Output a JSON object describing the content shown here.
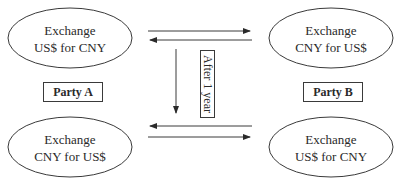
{
  "diagram": {
    "nodes": {
      "party_a_top": {
        "line1": "Exchange",
        "line2": "US$ for CNY"
      },
      "party_b_top": {
        "line1": "Exchange",
        "line2": "CNY for US$"
      },
      "party_a_bottom": {
        "line1": "Exchange",
        "line2": "CNY for US$"
      },
      "party_b_bottom": {
        "line1": "Exchange",
        "line2": "US$ for CNY"
      }
    },
    "party_a_label": "Party A",
    "party_b_label": "Party B",
    "time_label": "After 1 year",
    "colors": {
      "stroke": "#3a3a3a",
      "text": "#2a2a2a",
      "background": "#ffffff"
    }
  }
}
